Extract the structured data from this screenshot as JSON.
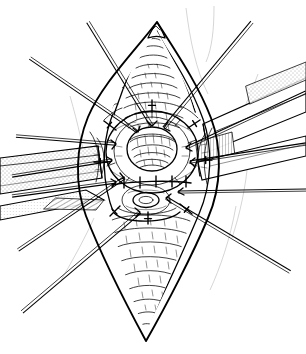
{
  "figure": {
    "kind": "surgical-line-drawing",
    "caption": "",
    "canvas": {
      "width": 306,
      "height": 354,
      "background": "#ffffff"
    },
    "ink_color": "#000000"
  },
  "scene": {
    "name": "vertical-lens-shaped-incision-with-central-ring",
    "description": "Diamond (lens) shaped opened operative field with a pointed superior apex and a pointed inferior apex, a central raised ring of tissue, a transverse suture line with interrupted stitches, a small inner opening below the ring, flat band retractors at left and right, and radiating traction instruments.",
    "elements": [
      {
        "id": "superior-apex",
        "label": "Superior apex of incision",
        "x": 157,
        "y": 22
      },
      {
        "id": "inferior-apex",
        "label": "Inferior apex of incision",
        "x": 146,
        "y": 341
      },
      {
        "id": "central-ring",
        "label": "Central ring of tissue",
        "cx": 152,
        "cy": 152,
        "rx": 45,
        "ry": 40
      },
      {
        "id": "ring-lumen",
        "label": "Ring lumen",
        "cx": 152,
        "cy": 149,
        "rx": 25,
        "ry": 22
      },
      {
        "id": "suture-line",
        "label": "Transverse interrupted suture line",
        "x1": 113,
        "y1": 184,
        "x2": 190,
        "y2": 183
      },
      {
        "id": "inner-opening",
        "label": "Small inferior opening",
        "cx": 146,
        "cy": 200,
        "rx": 13,
        "ry": 7
      },
      {
        "id": "left-retractor-blade",
        "label": "Left flat band retractor",
        "angle_deg": -10
      },
      {
        "id": "right-retractor-blade",
        "label": "Right flat band retractor",
        "angle_deg": 14
      }
    ],
    "instrument_count": 12,
    "suture_tick_count": 5
  },
  "geometry": {
    "field_outline": "M157,22 C176,52 198,84 211,118 C222,147 222,186 208,218 C193,254 166,306 146,341 C126,304 100,252 86,216 C74,184 76,146 88,117 C102,84 134,52 157,22 Z",
    "field_outline_inner": "M157,33 C174,60 192,88 203,119 C213,147 212,184 199,214 C185,247 163,296 146,328 C129,294 107,246 95,213 C83,183 85,147 96,119 C109,88 138,60 157,33 Z",
    "upper_lobe": "M157,32 C170,56 185,84 192,110 C181,125 168,133 153,133 C137,133 124,124 114,110 C123,83 142,56 157,32 Z",
    "lower_lobe": "M112,214 C124,211 138,209 152,210 C166,211 180,214 190,219 C178,252 160,300 146,330 C131,298 120,250 112,214 Z",
    "left_blade": "M0,160 L96,150 L100,180 L0,196 Z",
    "right_blade": "M201,122 L306,80 L306,112 L206,150 Z",
    "right_blade_lower": "M196,160 L306,138 L306,160 L200,178 Z"
  },
  "instruments": [
    {
      "id": "tool-1",
      "label": "traction instrument upper-left-outer",
      "x1": 88,
      "y1": 22,
      "x2": 152,
      "y2": 126,
      "offset": 3.0
    },
    {
      "id": "tool-2",
      "label": "traction instrument upper-left",
      "x1": 30,
      "y1": 58,
      "x2": 138,
      "y2": 132,
      "offset": 2.6
    },
    {
      "id": "tool-3",
      "label": "traction instrument mid-left-upper",
      "x1": 16,
      "y1": 136,
      "x2": 116,
      "y2": 144,
      "offset": 2.4
    },
    {
      "id": "tool-4",
      "label": "traction instrument mid-left",
      "x1": 12,
      "y1": 176,
      "x2": 112,
      "y2": 160,
      "offset": 2.3
    },
    {
      "id": "tool-5",
      "label": "traction instrument mid-left-lower",
      "x1": 12,
      "y1": 196,
      "x2": 116,
      "y2": 182,
      "offset": 2.3
    },
    {
      "id": "tool-6",
      "label": "traction instrument lower-left",
      "x1": 18,
      "y1": 250,
      "x2": 124,
      "y2": 178,
      "offset": 2.6
    },
    {
      "id": "tool-7",
      "label": "traction instrument lower-left-outer",
      "x1": 22,
      "y1": 312,
      "x2": 140,
      "y2": 212,
      "offset": 3.0
    },
    {
      "id": "tool-8",
      "label": "traction instrument upper-right",
      "x1": 252,
      "y1": 22,
      "x2": 164,
      "y2": 128,
      "offset": 3.0
    },
    {
      "id": "tool-9",
      "label": "traction instrument right-upper",
      "x1": 306,
      "y1": 92,
      "x2": 186,
      "y2": 148,
      "offset": 2.4
    },
    {
      "id": "tool-10",
      "label": "traction instrument right",
      "x1": 306,
      "y1": 144,
      "x2": 190,
      "y2": 162,
      "offset": 2.3
    },
    {
      "id": "tool-11",
      "label": "traction instrument right-lower",
      "x1": 306,
      "y1": 190,
      "x2": 178,
      "y2": 192,
      "offset": 2.2
    },
    {
      "id": "tool-12",
      "label": "traction instrument lower-right",
      "x1": 290,
      "y1": 272,
      "x2": 166,
      "y2": 198,
      "offset": 2.8
    }
  ],
  "suture_ticks": [
    {
      "x": 124,
      "y": 184
    },
    {
      "x": 140,
      "y": 184
    },
    {
      "x": 156,
      "y": 183
    },
    {
      "x": 172,
      "y": 183
    },
    {
      "x": 186,
      "y": 183
    }
  ],
  "radial_stitches": [
    {
      "x1": 152,
      "y1": 112,
      "x2": 152,
      "y2": 100,
      "cross": 7
    },
    {
      "x1": 188,
      "y1": 128,
      "x2": 200,
      "y2": 120,
      "cross": 7
    },
    {
      "x1": 198,
      "y1": 160,
      "x2": 212,
      "y2": 160,
      "cross": 7
    },
    {
      "x1": 116,
      "y1": 130,
      "x2": 104,
      "y2": 121,
      "cross": 7
    },
    {
      "x1": 108,
      "y1": 162,
      "x2": 94,
      "y2": 162,
      "cross": 7
    },
    {
      "x1": 120,
      "y1": 206,
      "x2": 110,
      "y2": 216,
      "cross": 7
    },
    {
      "x1": 148,
      "y1": 212,
      "x2": 148,
      "y2": 224,
      "cross": 7
    },
    {
      "x1": 180,
      "y1": 204,
      "x2": 192,
      "y2": 214,
      "cross": 7
    }
  ]
}
